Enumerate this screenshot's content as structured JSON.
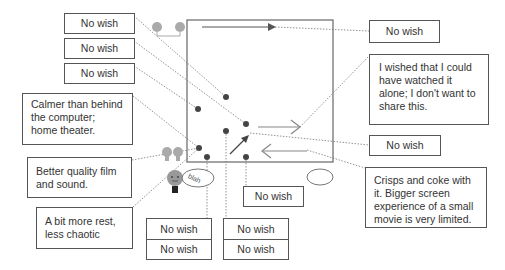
{
  "diagram": {
    "left_labels": [
      {
        "id": "l1",
        "text": "No wish"
      },
      {
        "id": "l2",
        "text": "No wish"
      },
      {
        "id": "l3",
        "text": "No wish"
      },
      {
        "id": "l4",
        "text": "Calmer than behind the computer; home theater."
      },
      {
        "id": "l5",
        "text": "Better quality film and sound."
      },
      {
        "id": "l6",
        "text": "A bit more rest, less chaotic"
      }
    ],
    "bottom_labels": [
      {
        "id": "b1",
        "text": "No wish"
      },
      {
        "id": "b2",
        "text": "No wish"
      },
      {
        "id": "b3",
        "text": "No wish"
      },
      {
        "id": "b4",
        "text": "No wish"
      },
      {
        "id": "b5",
        "text": "No wish"
      }
    ],
    "right_labels": [
      {
        "id": "r1",
        "text": "No wish"
      },
      {
        "id": "r2",
        "text": "I wished that I could have watched it alone; I don't want to share this."
      },
      {
        "id": "r3",
        "text": "No wish"
      },
      {
        "id": "r4",
        "text": "Crisps and coke with it. Bigger screen experience of a small movie is very limited."
      }
    ],
    "icons": {
      "people_top": "two-people-icon",
      "people_left": "two-people-icon",
      "person_face": "face-icon",
      "speech_blah": "speech-bubble-icon",
      "speech_empty": "thought-cloud-icon",
      "blah_text": "blah"
    },
    "colors": {
      "line": "#555555",
      "dot": "#444444",
      "arrow_light": "#888888",
      "icon_gray": "#aaaaaa"
    }
  }
}
